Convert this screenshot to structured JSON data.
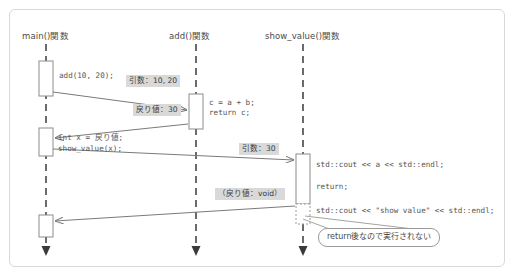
{
  "diagram": {
    "type": "uml-sequence-diagram",
    "title": "",
    "lifelines": [
      {
        "id": "main",
        "label": "main()関数",
        "x": 46
      },
      {
        "id": "add",
        "label": "add()関数",
        "x": 196
      },
      {
        "id": "show_value",
        "label": "show_value()関数",
        "x": 303
      }
    ],
    "messages": [
      {
        "id": "call-add",
        "from": "main",
        "to": "add",
        "label": "引数：10, 20",
        "kind": "call"
      },
      {
        "id": "return-add",
        "from": "add",
        "to": "main",
        "label": "戻り値：30",
        "kind": "return"
      },
      {
        "id": "call-show-value",
        "from": "main",
        "to": "show_value",
        "label": "引数：30",
        "kind": "call"
      },
      {
        "id": "return-show-value",
        "from": "show_value",
        "to": "main",
        "label": "（戻り値：void）",
        "kind": "return"
      }
    ],
    "code_blocks": [
      {
        "id": "main-call-add",
        "lifeline": "main",
        "lines": [
          "add(10, 20);"
        ]
      },
      {
        "id": "add-body",
        "lifeline": "add",
        "lines": [
          "c = a + b;",
          "return c;"
        ]
      },
      {
        "id": "main-after-add",
        "lifeline": "main",
        "lines": [
          "int x = 戻り値;",
          "show_value(x);"
        ]
      },
      {
        "id": "show-value-body",
        "lifeline": "show_value",
        "lines": [
          "std::cout << a << std::endl;",
          "return;"
        ]
      },
      {
        "id": "show-value-dead-code",
        "lifeline": "show_value",
        "lines": [
          "std::cout << \"show value\" << std::endl;"
        ]
      }
    ],
    "annotations": [
      {
        "id": "dead-code-note",
        "text": "return後なので実行されない"
      }
    ],
    "colors": {
      "frame_border": "#d8d8d8",
      "lifeline": "#5b5b5b",
      "activation_fill": "#ffffff",
      "activation_border": "#8c8c8c",
      "arrow": "#7a7a7a",
      "label_background": "#d9d9d9",
      "text": "#4a4a4a",
      "callout_border": "#9a9a9a"
    }
  }
}
